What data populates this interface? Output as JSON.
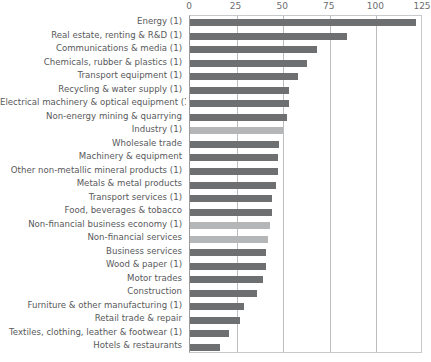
{
  "chart_data": {
    "type": "bar",
    "orientation": "horizontal",
    "title": "",
    "subtitle": "",
    "xlabel": "",
    "ylabel": "",
    "xlim": [
      0,
      125
    ],
    "xticks": [
      0,
      25,
      50,
      75,
      100,
      125
    ],
    "xtick_labels": [
      "0",
      "25",
      "50",
      "75",
      "100",
      "125"
    ],
    "grid": true,
    "legend": false,
    "bar_color": "#6e6f71",
    "highlight_color": "#b5b6b8",
    "categories": [
      "Energy (1)",
      "Real estate, renting & R&D (1)",
      "Communications & media (1)",
      "Chemicals, rubber & plastics (1)",
      "Transport equipment (1)",
      "Recycling & water supply (1)",
      "Electrical machinery & optical equipment (1)",
      "Non-energy mining & quarrying",
      "Industry (1)",
      "Wholesale trade",
      "Machinery & equipment",
      "Other non-metallic mineral products (1)",
      "Metals & metal products",
      "Transport services (1)",
      "Food, beverages & tobacco",
      "Non-financial business economy (1)",
      "Non-financial services",
      "Business services",
      "Wood & paper (1)",
      "Motor trades",
      "Construction",
      "Furniture & other manufacturing (1)",
      "Retail trade & repair",
      "Textiles, clothing, leather & footwear (1)",
      "Hotels & restaurants"
    ],
    "values": [
      121,
      84,
      68,
      63,
      58,
      53,
      53,
      52,
      50,
      48,
      47,
      47,
      46,
      44,
      44,
      43,
      42,
      41,
      41,
      39,
      36,
      29,
      27,
      21,
      16
    ],
    "highlighted": [
      "Industry (1)",
      "Non-financial business economy (1)",
      "Non-financial services"
    ]
  }
}
